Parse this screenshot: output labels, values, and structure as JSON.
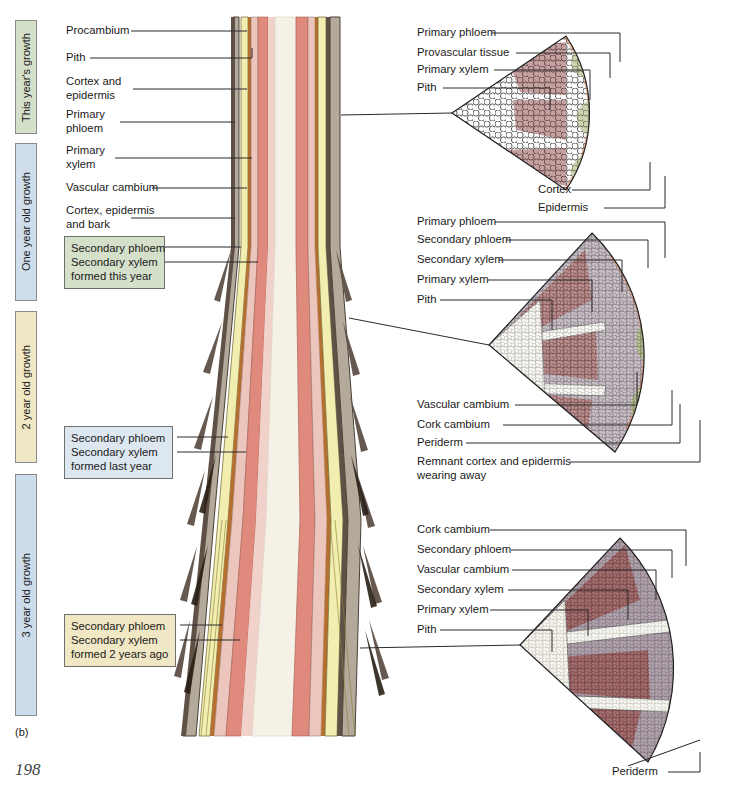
{
  "figure": {
    "caption_marker": "(b)",
    "page_number": "198",
    "title_hidden": "Secondary growth of a woody stem over three years"
  },
  "era_bars": [
    {
      "label": "This year's growth",
      "color": "#d5e0cb",
      "border": "#8a8a8a",
      "top": 20,
      "height": 114
    },
    {
      "label": "One year old growth",
      "color": "#cfdeea",
      "border": "#8a8a8a",
      "top": 143,
      "height": 158
    },
    {
      "label": "2 year old growth",
      "color": "#f0e7c4",
      "border": "#8a8a8a",
      "top": 311,
      "height": 152
    },
    {
      "label": "3 year old growth",
      "color": "#ccdcea",
      "border": "#8a8a8a",
      "top": 474,
      "height": 242
    }
  ],
  "left_labels": [
    {
      "text": "Procambium",
      "lines": [
        "Procambium"
      ]
    },
    {
      "text": "Pith",
      "lines": [
        "Pith"
      ]
    },
    {
      "text": "Cortex and epidermis",
      "lines": [
        "Cortex and",
        "epidermis"
      ]
    },
    {
      "text": "Primary phloem",
      "lines": [
        "Primary",
        "phloem"
      ]
    },
    {
      "text": "Primary xylem",
      "lines": [
        "Primary",
        "xylem"
      ]
    },
    {
      "text": "Vascular cambium",
      "lines": [
        "Vascular cambium"
      ]
    },
    {
      "text": "Cortex, epidermis and bark",
      "lines": [
        "Cortex, epidermis",
        "and bark"
      ]
    }
  ],
  "callouts": [
    {
      "id": "callout-this-year",
      "lines": [
        "Secondary phloem",
        "Secondary xylem",
        "formed this year"
      ],
      "fill": "#d5e0cb",
      "border": "#6f6f6f"
    },
    {
      "id": "callout-last-year",
      "lines": [
        "Secondary phloem",
        "Secondary xylem",
        "formed last year"
      ],
      "fill": "#dde7f0",
      "border": "#6f6f6f"
    },
    {
      "id": "callout-two-years-ago",
      "lines": [
        "Secondary phloem",
        "Secondary xylem",
        "formed 2 years ago"
      ],
      "fill": "#f0e7c4",
      "border": "#6f6f6f"
    }
  ],
  "wedges": [
    {
      "id": "wedge-this-year",
      "stage": "This year's growth",
      "labels_top": [
        "Primary phloem",
        "Provascular tissue",
        "Primary xylem",
        "Pith"
      ],
      "labels_bottom": [
        "Cortex",
        "Epidermis"
      ],
      "tissues": [
        "pith",
        "primary xylem",
        "provascular tissue",
        "primary phloem",
        "cortex",
        "epidermis"
      ]
    },
    {
      "id": "wedge-one-year",
      "stage": "One year old growth",
      "labels_top": [
        "Primary phloem",
        "Secondary phloem",
        "Secondary xylem",
        "Primary xylem",
        "Pith"
      ],
      "labels_bottom": [
        "Vascular cambium",
        "Cork cambium",
        "Periderm",
        "Remnant cortex and epidermis wearing away"
      ],
      "labels_bottom_wrapped": [
        [
          "Vascular cambium"
        ],
        [
          "Cork cambium"
        ],
        [
          "Periderm"
        ],
        [
          "Remnant cortex and epidermis",
          "wearing away"
        ]
      ],
      "tissues": [
        "pith",
        "primary xylem",
        "secondary xylem",
        "vascular cambium",
        "secondary phloem",
        "primary phloem",
        "cork cambium",
        "periderm",
        "remnant cortex"
      ]
    },
    {
      "id": "wedge-three-year",
      "stage": "3 year old growth",
      "labels_top": [
        "Cork cambium",
        "Secondary phloem",
        "Vascular cambium",
        "Secondary xylem",
        "Primary xylem",
        "Pith"
      ],
      "labels_bottom": [
        "Periderm"
      ],
      "tissues": [
        "pith",
        "primary xylem",
        "secondary xylem",
        "vascular cambium",
        "secondary phloem",
        "cork cambium",
        "periderm"
      ]
    }
  ],
  "palette": {
    "pith": "#f5f2e4",
    "primary_xylem": "#8e3433",
    "secondary_xylem": "#8f7d8c",
    "vascular_cambium": "#b85d32",
    "secondary_phloem": "#efeec6",
    "primary_phloem": "#8a9a4c",
    "cortex": "#b9b2a4",
    "epidermis": "#6b5a4a",
    "cork_cambium": "#c46a35",
    "periderm": "#4b3a2e",
    "stem_pith": "#f3ede2",
    "stem_xylem": "#e08a7d",
    "stem_secondary_xylem": "#ecc5bd",
    "stem_cambium": "#b5702f",
    "stem_phloem": "#f2eeb0",
    "stem_cortex": "#b3aa9c",
    "stem_bark": "#5f5146",
    "leader": "#2b2b2b"
  }
}
